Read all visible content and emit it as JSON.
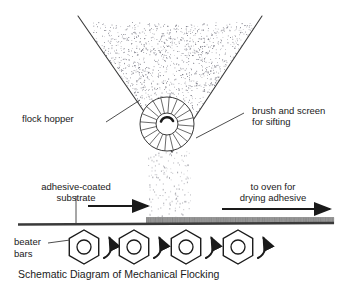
{
  "figure": {
    "caption": "Schematic Diagram of Mechanical Flocking",
    "background_color": "#ffffff",
    "ink_color": "#2b2b2b"
  },
  "labels": {
    "flock_hopper": "flock hopper",
    "brush_and_screen_line1": "brush and screen",
    "brush_and_screen_line2": "for sifting",
    "adhesive_substrate_line1": "adhesive-coated",
    "adhesive_substrate_line2": "substrate",
    "to_oven_line1": "to oven for",
    "to_oven_line2": "drying adhesive",
    "beater_bars_line1": "beater",
    "beater_bars_line2": "bars"
  },
  "components": {
    "hopper": {
      "name": "flock-hopper",
      "shape": "v-funnel",
      "top_left_x": 78,
      "top_right_x": 262,
      "top_y": 16,
      "apex_x": 172,
      "apex_y": 152,
      "fill": "stipple-flock"
    },
    "brush_wheel": {
      "name": "brush-and-screen-roller",
      "center_x": 167,
      "center_y": 124,
      "outer_radius": 27,
      "inner_radius": 11,
      "spoke_count": 20,
      "rotation_indicator": "arc-arrow"
    },
    "falling_flock": {
      "name": "falling-flock-particles",
      "left_x": 147,
      "right_x": 191,
      "top_y": 150,
      "bottom_y": 220,
      "particle_count": 150
    },
    "substrate": {
      "name": "substrate-web",
      "left_x": 18,
      "right_x": 334,
      "y": 224,
      "thickness": 3
    },
    "flocked_coating": {
      "name": "flocked-adhesive-layer",
      "start_x": 146,
      "end_x": 334,
      "y": 217,
      "height": 7,
      "color": "#9a9a9a"
    },
    "beater_bars": {
      "name": "beater-bars",
      "count": 4,
      "centers_x": [
        84,
        134,
        186,
        238
      ],
      "center_y": 247,
      "outer_radius": 17,
      "inner_radius": 7,
      "rotation_arrows": 4
    }
  },
  "arrows": {
    "feed_direction": {
      "name": "substrate-feed-arrow",
      "x1": 88,
      "x2": 148,
      "y": 206
    },
    "to_oven_direction": {
      "name": "to-oven-arrow",
      "x1": 222,
      "x2": 330,
      "y": 209
    }
  },
  "leaders": {
    "flock_hopper_leader": {
      "x1": 106,
      "y1": 122,
      "x2": 140,
      "y2": 100
    },
    "brush_screen_leader": {
      "x1": 244,
      "y1": 113,
      "x2": 196,
      "y2": 138
    },
    "substrate_leader": {
      "x1": 76,
      "y1": 196,
      "x2": 76,
      "y2": 223
    },
    "beater_bars_leader": {
      "x1": 48,
      "y1": 243,
      "x2": 70,
      "y2": 240
    }
  }
}
